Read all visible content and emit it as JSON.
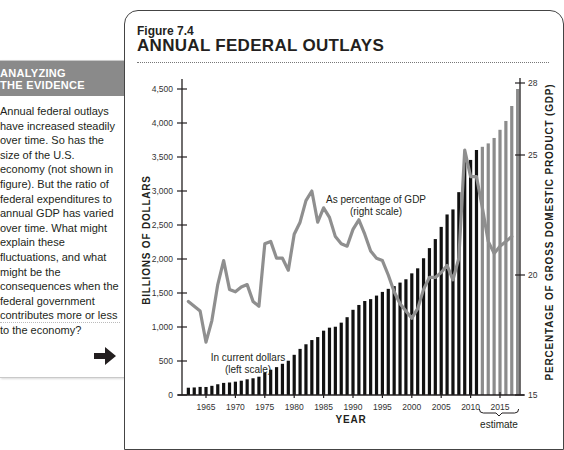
{
  "sidebar": {
    "heading_line1": "ANALYZING",
    "heading_line2": "THE EVIDENCE",
    "body": "Annual federal outlays have increased steadily over time. So has the size of the U.S. economy (not shown in figure). But the ratio of federal expenditures to annual GDP has varied over time. What might explain these fluctuations, and what might be the consequences when the federal government contributes more or less to the economy?",
    "arrow_icon": "right-arrow-icon"
  },
  "figure": {
    "label": "Figure 7.4",
    "title": "ANNUAL FEDERAL OUTLAYS"
  },
  "colors": {
    "bars_actual": "#111111",
    "bars_estimate": "#8c8c8c",
    "gdp_line": "#8f8f8f",
    "sidebar_header": "#8a8a8a"
  },
  "chart_data": {
    "type": "bar+line",
    "title": "ANNUAL FEDERAL OUTLAYS",
    "xlabel": "YEAR",
    "ylabel_left": "BILLIONS OF DOLLARS",
    "ylabel_right": "PERCENTAGE OF GROSS DOMESTIC PRODUCT (GDP)",
    "ylim_left": [
      0,
      4500
    ],
    "ylim_right": [
      15,
      28
    ],
    "left_ticks": [
      0,
      500,
      1000,
      1500,
      2000,
      2500,
      3000,
      3500,
      4000,
      4500
    ],
    "left_tick_labels": [
      "0",
      "500",
      "1,000",
      "1,500",
      "2,000",
      "2,500",
      "3,000",
      "3,500",
      "4,000",
      "4,500"
    ],
    "right_ticks": [
      15,
      20,
      25,
      28
    ],
    "x_ticks": [
      1965,
      1970,
      1975,
      1980,
      1985,
      1990,
      1995,
      2000,
      2005,
      2010,
      2015
    ],
    "grid": false,
    "annotations": [
      {
        "text": "In current dollars",
        "text2": "(left scale)"
      },
      {
        "text": "As percentage of GDP",
        "text2": "(right scale)"
      },
      {
        "text": "estimate",
        "range": [
          2012,
          2018
        ]
      }
    ],
    "series": [
      {
        "name": "In current dollars (left scale)",
        "type": "bar",
        "years": [
          1962,
          1963,
          1964,
          1965,
          1966,
          1967,
          1968,
          1969,
          1970,
          1971,
          1972,
          1973,
          1974,
          1975,
          1976,
          1977,
          1978,
          1979,
          1980,
          1981,
          1982,
          1983,
          1984,
          1985,
          1986,
          1987,
          1988,
          1989,
          1990,
          1991,
          1992,
          1993,
          1994,
          1995,
          1996,
          1997,
          1998,
          1999,
          2000,
          2001,
          2002,
          2003,
          2004,
          2005,
          2006,
          2007,
          2008,
          2009,
          2010,
          2011,
          2012,
          2013,
          2014,
          2015,
          2016,
          2017,
          2018
        ],
        "values": [
          107,
          111,
          119,
          118,
          135,
          158,
          178,
          184,
          196,
          210,
          231,
          246,
          269,
          332,
          372,
          410,
          459,
          504,
          591,
          678,
          746,
          808,
          852,
          946,
          990,
          1004,
          1064,
          1144,
          1253,
          1324,
          1382,
          1410,
          1462,
          1516,
          1561,
          1601,
          1653,
          1702,
          1789,
          1863,
          2011,
          2160,
          2293,
          2472,
          2655,
          2729,
          2983,
          3518,
          3457,
          3603,
          3650,
          3700,
          3780,
          3900,
          4030,
          4250,
          4500
        ],
        "estimate_from": 2012
      },
      {
        "name": "As percentage of GDP (right scale)",
        "type": "line",
        "years": [
          1962,
          1963,
          1964,
          1965,
          1966,
          1967,
          1968,
          1969,
          1970,
          1971,
          1972,
          1973,
          1974,
          1975,
          1976,
          1977,
          1978,
          1979,
          1980,
          1981,
          1982,
          1983,
          1984,
          1985,
          1986,
          1987,
          1988,
          1989,
          1990,
          1991,
          1992,
          1993,
          1994,
          1995,
          1996,
          1997,
          1998,
          1999,
          2000,
          2001,
          2002,
          2003,
          2004,
          2005,
          2006,
          2007,
          2008,
          2009,
          2010,
          2011,
          2012,
          2013,
          2014,
          2015,
          2016,
          2017
        ],
        "values": [
          18.9,
          18.7,
          18.5,
          17.2,
          18.1,
          19.6,
          20.6,
          19.4,
          19.3,
          19.5,
          19.6,
          18.9,
          18.7,
          21.3,
          21.4,
          20.7,
          20.7,
          20.2,
          21.7,
          22.2,
          23.1,
          23.5,
          22.2,
          22.8,
          22.4,
          21.6,
          21.3,
          21.2,
          21.9,
          22.3,
          21.7,
          21.0,
          20.7,
          20.6,
          20.0,
          19.3,
          18.8,
          18.5,
          18.2,
          18.6,
          19.4,
          19.9,
          19.9,
          20.1,
          20.4,
          19.8,
          20.7,
          25.2,
          24.1,
          24.1,
          22.8,
          21.4,
          20.9,
          21.2,
          21.4,
          21.6
        ]
      }
    ]
  }
}
